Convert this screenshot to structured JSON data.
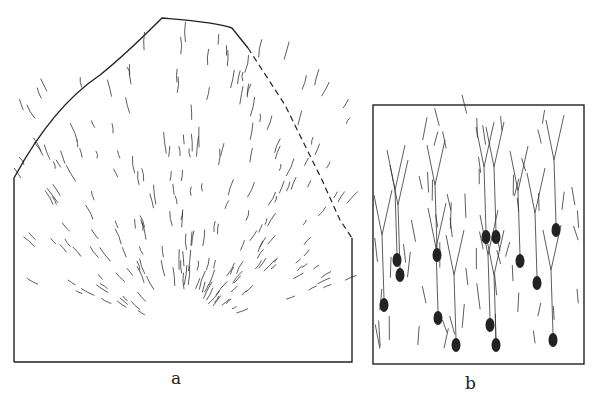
{
  "figure": {
    "panels": [
      {
        "id": "a",
        "label": "a",
        "description": "Radially branching fibres / glial processes in a tissue section with dome-shaped outline"
      },
      {
        "id": "b",
        "label": "b",
        "description": "Layer of pyramidal-like neurons with dark cell bodies and ascending branching dendrites"
      }
    ]
  }
}
